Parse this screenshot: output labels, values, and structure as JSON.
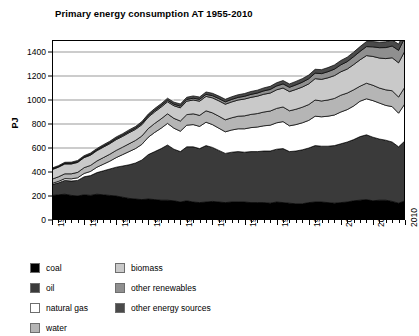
{
  "chart_data": {
    "type": "area",
    "stacked": true,
    "title": "Primary energy consumption AT 1955-2010",
    "xlabel": "",
    "ylabel": "PJ",
    "ylim": [
      0,
      1500
    ],
    "xlim": [
      1955,
      2010
    ],
    "grid": true,
    "legend_position": "below",
    "ytick_labels": [
      "0",
      "200",
      "400",
      "600",
      "800",
      "1000",
      "1200",
      "1400"
    ],
    "ytick_values": [
      0,
      200,
      400,
      600,
      800,
      1000,
      1200,
      1400
    ],
    "xtick_labels": [
      "1955",
      "1960",
      "1965",
      "1970",
      "1975",
      "1980",
      "1985",
      "1990",
      "1995",
      "2000",
      "2005",
      "2010"
    ],
    "xtick_values": [
      1955,
      1960,
      1965,
      1970,
      1975,
      1980,
      1985,
      1990,
      1995,
      2000,
      2005,
      2010
    ],
    "x": [
      1955,
      1956,
      1957,
      1958,
      1959,
      1960,
      1961,
      1962,
      1963,
      1964,
      1965,
      1966,
      1967,
      1968,
      1969,
      1970,
      1971,
      1972,
      1973,
      1974,
      1975,
      1976,
      1977,
      1978,
      1979,
      1980,
      1981,
      1982,
      1983,
      1984,
      1985,
      1986,
      1987,
      1988,
      1989,
      1990,
      1991,
      1992,
      1993,
      1994,
      1995,
      1996,
      1997,
      1998,
      1999,
      2000,
      2001,
      2002,
      2003,
      2004,
      2005,
      2006,
      2007,
      2008,
      2009,
      2010
    ],
    "series": [
      {
        "name": "coal",
        "color": "#000000",
        "values": [
          205,
          210,
          215,
          205,
          200,
          210,
          205,
          215,
          210,
          205,
          200,
          190,
          180,
          175,
          170,
          175,
          170,
          165,
          165,
          160,
          150,
          160,
          150,
          145,
          150,
          155,
          150,
          145,
          150,
          150,
          150,
          145,
          145,
          145,
          140,
          150,
          145,
          140,
          135,
          135,
          145,
          150,
          150,
          145,
          140,
          145,
          150,
          160,
          165,
          170,
          160,
          165,
          165,
          155,
          140,
          160
        ]
      },
      {
        "name": "oil",
        "color": "#3a3a3a",
        "values": [
          90,
          100,
          115,
          120,
          130,
          150,
          165,
          180,
          200,
          220,
          240,
          260,
          280,
          300,
          330,
          370,
          400,
          430,
          460,
          430,
          420,
          450,
          460,
          450,
          470,
          450,
          430,
          410,
          415,
          420,
          415,
          425,
          425,
          430,
          435,
          440,
          450,
          430,
          440,
          450,
          455,
          470,
          465,
          470,
          480,
          490,
          500,
          510,
          530,
          540,
          530,
          510,
          500,
          495,
          470,
          500
        ]
      },
      {
        "name": "natural gas",
        "color": "#ffffff",
        "values": [
          10,
          12,
          15,
          18,
          22,
          28,
          35,
          45,
          55,
          65,
          80,
          95,
          110,
          120,
          130,
          145,
          160,
          170,
          180,
          175,
          170,
          180,
          185,
          185,
          195,
          190,
          185,
          180,
          185,
          190,
          195,
          200,
          205,
          210,
          215,
          220,
          225,
          215,
          220,
          225,
          230,
          245,
          245,
          250,
          255,
          265,
          270,
          280,
          295,
          300,
          305,
          300,
          290,
          295,
          280,
          310
        ]
      },
      {
        "name": "water",
        "color": "#b5b5b5",
        "values": [
          35,
          38,
          40,
          42,
          45,
          48,
          50,
          52,
          55,
          58,
          60,
          62,
          65,
          68,
          70,
          72,
          75,
          78,
          80,
          82,
          85,
          88,
          90,
          92,
          95,
          98,
          100,
          100,
          102,
          105,
          108,
          110,
          112,
          115,
          118,
          120,
          122,
          125,
          128,
          130,
          132,
          135,
          132,
          135,
          138,
          140,
          138,
          135,
          125,
          130,
          128,
          125,
          130,
          132,
          135,
          140
        ]
      },
      {
        "name": "biomass",
        "color": "#c9c9c9",
        "values": [
          80,
          80,
          82,
          82,
          83,
          84,
          85,
          86,
          87,
          88,
          90,
          90,
          92,
          92,
          94,
          95,
          96,
          98,
          100,
          105,
          110,
          112,
          115,
          118,
          120,
          125,
          128,
          130,
          132,
          135,
          140,
          142,
          145,
          148,
          150,
          155,
          158,
          160,
          165,
          168,
          172,
          178,
          180,
          185,
          190,
          195,
          200,
          210,
          220,
          230,
          240,
          250,
          260,
          275,
          285,
          300
        ]
      },
      {
        "name": "other renewables",
        "color": "#8f8f8f",
        "values": [
          5,
          5,
          5,
          6,
          6,
          6,
          7,
          7,
          8,
          8,
          9,
          9,
          10,
          10,
          11,
          11,
          12,
          12,
          13,
          13,
          14,
          15,
          15,
          16,
          17,
          18,
          19,
          20,
          21,
          22,
          23,
          25,
          26,
          28,
          30,
          32,
          34,
          36,
          38,
          40,
          43,
          46,
          48,
          51,
          54,
          58,
          62,
          66,
          70,
          75,
          80,
          86,
          92,
          98,
          104,
          112
        ]
      },
      {
        "name": "other energy sources",
        "color": "#4a4a4a",
        "values": [
          8,
          8,
          9,
          9,
          10,
          10,
          11,
          11,
          12,
          12,
          13,
          13,
          14,
          14,
          15,
          15,
          16,
          16,
          17,
          17,
          18,
          18,
          19,
          19,
          20,
          20,
          21,
          21,
          22,
          22,
          23,
          24,
          24,
          25,
          26,
          27,
          28,
          28,
          29,
          30,
          31,
          32,
          33,
          34,
          35,
          36,
          37,
          38,
          40,
          42,
          44,
          46,
          48,
          50,
          52,
          55
        ]
      }
    ],
    "totals_note": "Totals rise from about 430 PJ in 1955 to about 1475 PJ in 2010, peaking near 1490 PJ in 2005 with a dip near 1395 PJ in 2009."
  },
  "legend": {
    "columns": [
      {
        "items": [
          {
            "label": "coal",
            "color": "#000000"
          },
          {
            "label": "oil",
            "color": "#3a3a3a"
          },
          {
            "label": "natural gas",
            "color": "#ffffff"
          },
          {
            "label": "water",
            "color": "#b5b5b5"
          }
        ]
      },
      {
        "items": [
          {
            "label": "biomass",
            "color": "#c9c9c9"
          },
          {
            "label": "other renewables",
            "color": "#8f8f8f"
          },
          {
            "label": "other energy sources",
            "color": "#4a4a4a"
          }
        ]
      }
    ]
  }
}
